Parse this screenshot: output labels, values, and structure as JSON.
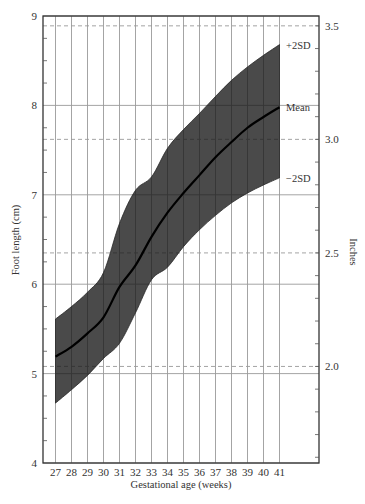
{
  "chart_data": {
    "type": "area",
    "title": "",
    "xlabel": "Gestational age (weeks)",
    "ylabel": "Foot length (cm)",
    "ylabel_right": "Inches",
    "x": [
      27,
      28,
      29,
      30,
      31,
      32,
      33,
      34,
      35,
      36,
      37,
      38,
      39,
      40,
      41
    ],
    "xlim": [
      26.25,
      43.4
    ],
    "ylim": [
      4,
      9
    ],
    "yticks": [
      4,
      5,
      6,
      7,
      8,
      9
    ],
    "yticks_right": [
      2.0,
      2.5,
      3.0,
      3.5
    ],
    "grid": true,
    "series": [
      {
        "name": "+2SD",
        "values": [
          5.61,
          5.75,
          5.91,
          6.13,
          6.68,
          7.05,
          7.2,
          7.52,
          7.73,
          7.91,
          8.1,
          8.28,
          8.43,
          8.56,
          8.68
        ]
      },
      {
        "name": "Mean",
        "values": [
          5.19,
          5.3,
          5.45,
          5.63,
          5.97,
          6.21,
          6.53,
          6.8,
          7.02,
          7.22,
          7.42,
          7.59,
          7.75,
          7.87,
          7.98
        ]
      },
      {
        "name": "−2SD",
        "values": [
          4.67,
          4.82,
          4.98,
          5.17,
          5.34,
          5.68,
          6.05,
          6.19,
          6.42,
          6.61,
          6.77,
          6.91,
          7.02,
          7.11,
          7.19
        ]
      }
    ],
    "band": {
      "upper": "+2SD",
      "lower": "−2SD",
      "fill": "#4a4a4a"
    },
    "colors": {
      "band": "#4a4a4a",
      "mean_line": "#000000",
      "grid": "#9a9a9a",
      "frame": "#333333"
    }
  },
  "labels": {
    "upper": "+2SD",
    "mean": "Mean",
    "lower": "−2SD",
    "ylabel": "Foot length (cm)",
    "ylabel_right": "Inches",
    "xlabel": "Gestational age (weeks)"
  }
}
